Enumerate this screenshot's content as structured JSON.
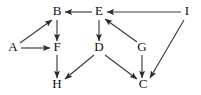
{
  "diagram": {
    "type": "directed-graph",
    "background_color": "#ffffff",
    "node_color": "#0d0d0d",
    "edge_color": "#3a3a3a",
    "arrow_color": "#2b2b2b",
    "width": 201,
    "height": 95,
    "nodes": [
      {
        "id": "B",
        "label": "B",
        "x": 57,
        "y": 12
      },
      {
        "id": "E",
        "label": "E",
        "x": 99,
        "y": 12
      },
      {
        "id": "I",
        "label": "I",
        "x": 187,
        "y": 12
      },
      {
        "id": "A",
        "label": "A",
        "x": 13,
        "y": 48
      },
      {
        "id": "F",
        "label": "F",
        "x": 57,
        "y": 48
      },
      {
        "id": "D",
        "label": "D",
        "x": 99,
        "y": 48
      },
      {
        "id": "G",
        "label": "G",
        "x": 142,
        "y": 48
      },
      {
        "id": "H",
        "label": "H",
        "x": 57,
        "y": 85
      },
      {
        "id": "C",
        "label": "C",
        "x": 143,
        "y": 85
      }
    ],
    "edges": [
      {
        "id": "A-B",
        "from": "A",
        "to": "B",
        "label": "A to B",
        "x1": 20,
        "y1": 43,
        "x2": 52,
        "y2": 20
      },
      {
        "id": "A-F",
        "from": "A",
        "to": "F",
        "label": "A to F",
        "x1": 21,
        "y1": 48,
        "x2": 50,
        "y2": 48
      },
      {
        "id": "B-F",
        "from": "B",
        "to": "F",
        "label": "B to F",
        "x1": 57,
        "y1": 20,
        "x2": 57,
        "y2": 41
      },
      {
        "id": "E-B",
        "from": "E",
        "to": "B",
        "label": "E to B",
        "x1": 92,
        "y1": 12,
        "x2": 65,
        "y2": 12
      },
      {
        "id": "E-D",
        "from": "E",
        "to": "D",
        "label": "E to D",
        "x1": 99,
        "y1": 20,
        "x2": 99,
        "y2": 41
      },
      {
        "id": "G-E",
        "from": "G",
        "to": "E",
        "label": "G to E",
        "x1": 137,
        "y1": 42,
        "x2": 105,
        "y2": 19
      },
      {
        "id": "I-E",
        "from": "I",
        "to": "E",
        "label": "I to E",
        "x1": 181,
        "y1": 12,
        "x2": 107,
        "y2": 12
      },
      {
        "id": "F-H",
        "from": "F",
        "to": "H",
        "label": "F to H",
        "x1": 57,
        "y1": 55,
        "x2": 57,
        "y2": 78
      },
      {
        "id": "D-H",
        "from": "D",
        "to": "H",
        "label": "D to H",
        "x1": 94,
        "y1": 55,
        "x2": 65,
        "y2": 79
      },
      {
        "id": "D-C",
        "from": "D",
        "to": "C",
        "label": "D to C",
        "x1": 105,
        "y1": 55,
        "x2": 137,
        "y2": 79
      },
      {
        "id": "G-C",
        "from": "G",
        "to": "C",
        "label": "G to C",
        "x1": 142,
        "y1": 55,
        "x2": 142,
        "y2": 78
      },
      {
        "id": "I-C",
        "from": "I",
        "to": "C",
        "label": "I to C",
        "x1": 184,
        "y1": 20,
        "x2": 150,
        "y2": 78
      }
    ]
  }
}
